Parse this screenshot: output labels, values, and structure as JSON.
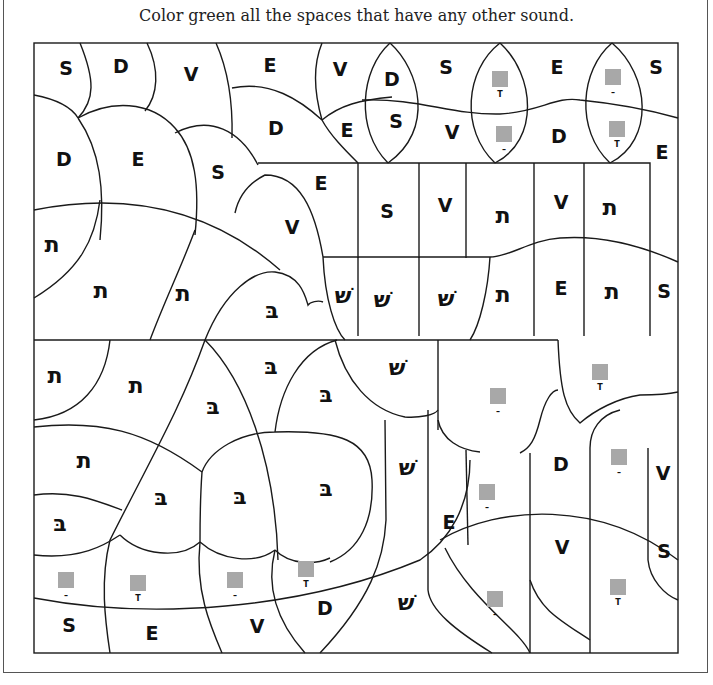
{
  "instruction": "Color green all the spaces that have any other sound.",
  "colors": {
    "target_fill": "green",
    "placeholder_square": "#a8a8a8"
  },
  "letters": {
    "S": "S",
    "D": "D",
    "V": "V",
    "E": "E",
    "tav": "ת",
    "shin": "שׁ",
    "bet": "בּ"
  },
  "vowel_marks": {
    "kamatz": "T",
    "patach": "–"
  },
  "regions": [
    {
      "id": "r1",
      "type": "letter",
      "key": "S"
    },
    {
      "id": "r2",
      "type": "letter",
      "key": "D"
    },
    {
      "id": "r3",
      "type": "letter",
      "key": "V"
    },
    {
      "id": "r4",
      "type": "letter",
      "key": "E"
    },
    {
      "id": "r5",
      "type": "letter",
      "key": "V"
    },
    {
      "id": "r6",
      "type": "letter",
      "key": "D"
    },
    {
      "id": "r7",
      "type": "letter",
      "key": "S"
    },
    {
      "id": "r8",
      "type": "square",
      "vowel": "kamatz"
    },
    {
      "id": "r9",
      "type": "letter",
      "key": "E"
    },
    {
      "id": "r10",
      "type": "square",
      "vowel": "patach"
    },
    {
      "id": "r11",
      "type": "letter",
      "key": "S"
    },
    {
      "id": "r12",
      "type": "letter",
      "key": "D"
    },
    {
      "id": "r13",
      "type": "letter",
      "key": "E"
    },
    {
      "id": "r14",
      "type": "letter",
      "key": "S"
    },
    {
      "id": "r15",
      "type": "letter",
      "key": "V"
    },
    {
      "id": "r16",
      "type": "square",
      "vowel": "patach"
    },
    {
      "id": "r17",
      "type": "letter",
      "key": "D"
    },
    {
      "id": "r18",
      "type": "square",
      "vowel": "kamatz"
    },
    {
      "id": "r19",
      "type": "letter",
      "key": "E"
    },
    {
      "id": "r20",
      "type": "letter",
      "key": "D"
    },
    {
      "id": "r21",
      "type": "letter",
      "key": "E"
    },
    {
      "id": "r22",
      "type": "letter",
      "key": "S"
    },
    {
      "id": "r23",
      "type": "letter",
      "key": "E"
    },
    {
      "id": "r24",
      "type": "letter",
      "key": "S"
    },
    {
      "id": "r25",
      "type": "letter",
      "key": "V"
    },
    {
      "id": "r26",
      "type": "letter",
      "key": "tav"
    },
    {
      "id": "r27",
      "type": "letter",
      "key": "V"
    },
    {
      "id": "r28",
      "type": "letter",
      "key": "tav"
    },
    {
      "id": "r29",
      "type": "letter",
      "key": "V"
    },
    {
      "id": "r30",
      "type": "letter",
      "key": "tav"
    },
    {
      "id": "r31",
      "type": "letter",
      "key": "tav"
    },
    {
      "id": "r32",
      "type": "letter",
      "key": "tav"
    },
    {
      "id": "r33",
      "type": "letter",
      "key": "bet"
    },
    {
      "id": "r34",
      "type": "letter",
      "key": "shin"
    },
    {
      "id": "r35",
      "type": "letter",
      "key": "shin"
    },
    {
      "id": "r36",
      "type": "letter",
      "key": "shin"
    },
    {
      "id": "r37",
      "type": "letter",
      "key": "tav"
    },
    {
      "id": "r38",
      "type": "letter",
      "key": "E"
    },
    {
      "id": "r39",
      "type": "letter",
      "key": "tav"
    },
    {
      "id": "r40",
      "type": "letter",
      "key": "S"
    },
    {
      "id": "r41",
      "type": "letter",
      "key": "tav"
    },
    {
      "id": "r42",
      "type": "letter",
      "key": "tav"
    },
    {
      "id": "r43",
      "type": "letter",
      "key": "bet"
    },
    {
      "id": "r44",
      "type": "letter",
      "key": "bet"
    },
    {
      "id": "r45",
      "type": "letter",
      "key": "bet"
    },
    {
      "id": "r46",
      "type": "letter",
      "key": "shin"
    },
    {
      "id": "r47",
      "type": "square",
      "vowel": "patach"
    },
    {
      "id": "r48",
      "type": "square",
      "vowel": "kamatz"
    },
    {
      "id": "r49",
      "type": "letter",
      "key": "tav"
    },
    {
      "id": "r50",
      "type": "letter",
      "key": "shin"
    },
    {
      "id": "r51",
      "type": "letter",
      "key": "D"
    },
    {
      "id": "r52",
      "type": "square",
      "vowel": "patach"
    },
    {
      "id": "r53",
      "type": "letter",
      "key": "V"
    },
    {
      "id": "r54",
      "type": "square",
      "vowel": "patach"
    },
    {
      "id": "r55",
      "type": "letter",
      "key": "bet"
    },
    {
      "id": "r56",
      "type": "letter",
      "key": "bet"
    },
    {
      "id": "r57",
      "type": "letter",
      "key": "bet"
    },
    {
      "id": "r58",
      "type": "letter",
      "key": "bet"
    },
    {
      "id": "r59",
      "type": "letter",
      "key": "E"
    },
    {
      "id": "r60",
      "type": "letter",
      "key": "V"
    },
    {
      "id": "r61",
      "type": "letter",
      "key": "S"
    },
    {
      "id": "r62",
      "type": "square",
      "vowel": "patach"
    },
    {
      "id": "r63",
      "type": "square",
      "vowel": "kamatz"
    },
    {
      "id": "r64",
      "type": "square",
      "vowel": "patach"
    },
    {
      "id": "r65",
      "type": "square",
      "vowel": "kamatz"
    },
    {
      "id": "r66",
      "type": "letter",
      "key": "shin"
    },
    {
      "id": "r67",
      "type": "square",
      "vowel": "patach"
    },
    {
      "id": "r68",
      "type": "square",
      "vowel": "kamatz"
    },
    {
      "id": "r69",
      "type": "letter",
      "key": "S"
    },
    {
      "id": "r70",
      "type": "letter",
      "key": "E"
    },
    {
      "id": "r71",
      "type": "letter",
      "key": "V"
    },
    {
      "id": "r72",
      "type": "letter",
      "key": "D"
    }
  ]
}
